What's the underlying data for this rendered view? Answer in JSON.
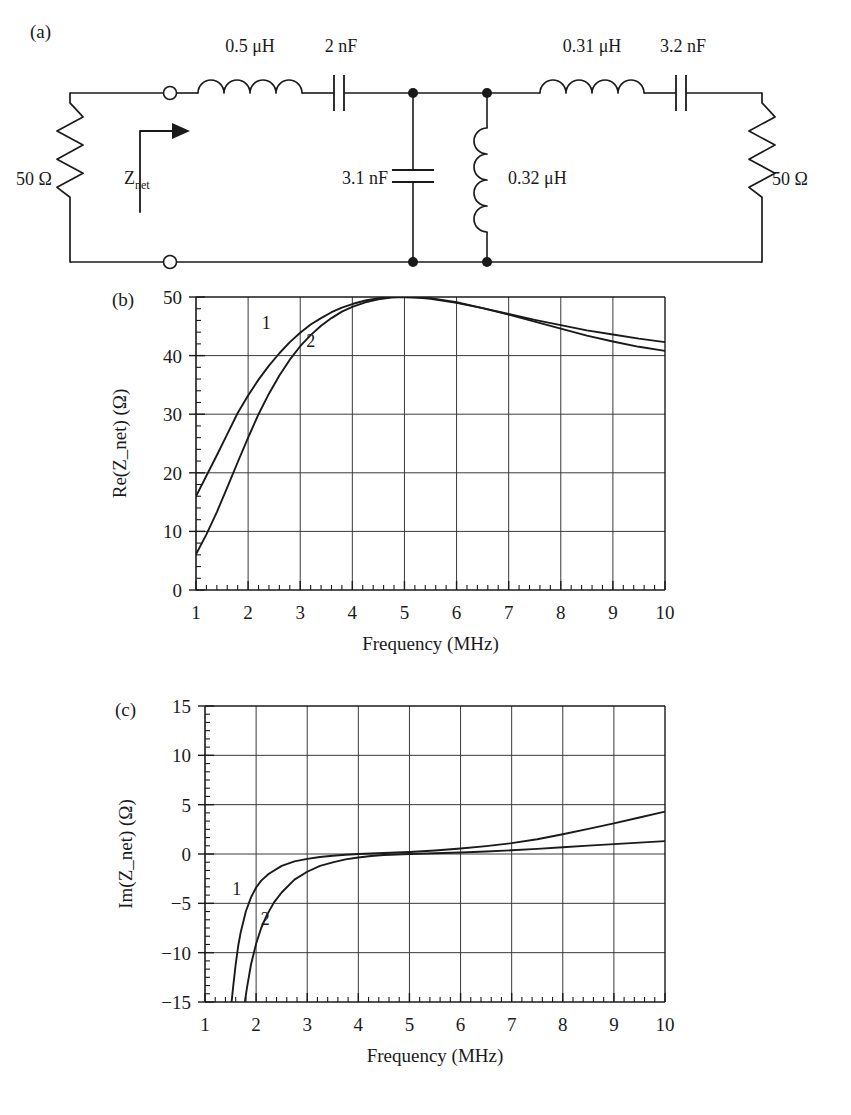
{
  "figure": {
    "panels": [
      {
        "tag": "(a)",
        "kind": "circuit-schematic"
      },
      {
        "tag": "(b)",
        "kind": "chart"
      },
      {
        "tag": "(c)",
        "kind": "chart"
      }
    ]
  },
  "circuit": {
    "tag": "(a)",
    "source_resistor_label": "50 Ω",
    "load_resistor_label": "50 Ω",
    "input_impedance_label_main": "Z",
    "input_impedance_label_sub": "net",
    "series_inductor_1": "0.5 μH",
    "series_capacitor_1": "2 nF",
    "shunt_capacitor": "3.1 nF",
    "shunt_inductor": "0.32 μH",
    "series_inductor_2": "0.31 μH",
    "series_capacitor_2": "3.2 nF",
    "icons": [
      "resistor-icon",
      "inductor-icon",
      "capacitor-icon",
      "terminal-node-icon",
      "junction-dot-icon",
      "current-direction-arrow-icon"
    ]
  },
  "chart_data": [
    {
      "panel": "(b)",
      "type": "line",
      "title": "",
      "xlabel": "Frequency (MHz)",
      "ylabel": "Re(Z_net) (Ω)",
      "xlim": [
        1,
        10
      ],
      "ylim": [
        0,
        50
      ],
      "xticks": [
        1,
        2,
        3,
        4,
        5,
        6,
        7,
        8,
        9,
        10
      ],
      "yticks": [
        0,
        10,
        20,
        30,
        40,
        50
      ],
      "xticklabels": [
        "1",
        "2",
        "3",
        "4",
        "5",
        "6",
        "7",
        "8",
        "9",
        "10"
      ],
      "yticklabels": [
        "0",
        "10",
        "20",
        "30",
        "40",
        "50"
      ],
      "xminor_per_interval": 4,
      "yminor_per_interval": 4,
      "grid": true,
      "legend": "inline-curve-labels",
      "annotations": [
        {
          "text": "1",
          "x": 2.35,
          "y": 44.6
        },
        {
          "text": "2",
          "x": 3.2,
          "y": 41.4
        }
      ],
      "series": [
        {
          "name": "1",
          "x": [
            1.0,
            1.2,
            1.4,
            1.6,
            1.8,
            2.0,
            2.2,
            2.4,
            2.6,
            2.8,
            3.0,
            3.2,
            3.4,
            3.6,
            3.8,
            4.0,
            4.25,
            4.5,
            4.75,
            5.0,
            5.25,
            5.5,
            6.0,
            6.5,
            7.0,
            7.5,
            8.0,
            8.5,
            9.0,
            9.5,
            10.0
          ],
          "y": [
            16.0,
            19.5,
            23.0,
            26.6,
            30.2,
            33.2,
            35.9,
            38.3,
            40.4,
            42.3,
            43.9,
            45.3,
            46.4,
            47.4,
            48.2,
            48.8,
            49.4,
            49.8,
            50.0,
            50.0,
            49.9,
            49.7,
            49.0,
            48.1,
            47.1,
            46.1,
            45.2,
            44.3,
            43.6,
            42.9,
            42.3
          ]
        },
        {
          "name": "2",
          "x": [
            1.0,
            1.2,
            1.4,
            1.6,
            1.8,
            2.0,
            2.2,
            2.4,
            2.6,
            2.8,
            3.0,
            3.2,
            3.4,
            3.6,
            3.8,
            4.0,
            4.25,
            4.5,
            4.75,
            5.0,
            5.25,
            5.5,
            6.0,
            6.5,
            7.0,
            7.5,
            8.0,
            8.5,
            9.0,
            9.5,
            10.0
          ],
          "y": [
            6.1,
            9.5,
            13.3,
            17.5,
            21.8,
            26.0,
            30.0,
            33.5,
            36.6,
            39.3,
            41.6,
            43.5,
            45.1,
            46.4,
            47.5,
            48.3,
            49.1,
            49.6,
            49.9,
            50.0,
            49.9,
            49.8,
            49.1,
            48.1,
            47.0,
            45.8,
            44.6,
            43.4,
            42.4,
            41.5,
            40.8
          ]
        }
      ]
    },
    {
      "panel": "(c)",
      "type": "line",
      "title": "",
      "xlabel": "Frequency (MHz)",
      "ylabel": "Im(Z_net) (Ω)",
      "xlim": [
        1,
        10
      ],
      "ylim": [
        -15,
        15
      ],
      "xticks": [
        1,
        2,
        3,
        4,
        5,
        6,
        7,
        8,
        9,
        10
      ],
      "yticks": [
        -15,
        -10,
        -5,
        0,
        5,
        10,
        15
      ],
      "xticklabels": [
        "1",
        "2",
        "3",
        "4",
        "5",
        "6",
        "7",
        "8",
        "9",
        "10"
      ],
      "yticklabels": [
        "−15",
        "−10",
        "−5",
        "0",
        "5",
        "10",
        "15"
      ],
      "xminor_per_interval": 4,
      "yminor_per_interval": 5,
      "grid": true,
      "legend": "inline-curve-labels",
      "annotations": [
        {
          "text": "1",
          "x": 1.62,
          "y": -4.2
        },
        {
          "text": "2",
          "x": 2.18,
          "y": -7.2
        }
      ],
      "series": [
        {
          "name": "1",
          "x": [
            1.52,
            1.55,
            1.6,
            1.65,
            1.7,
            1.8,
            1.9,
            2.0,
            2.1,
            2.25,
            2.5,
            2.75,
            3.0,
            3.25,
            3.5,
            3.75,
            4.0,
            4.5,
            5.0,
            5.5,
            6.0,
            6.5,
            7.0,
            7.5,
            8.0,
            8.5,
            9.0,
            9.5,
            10.0
          ],
          "y": [
            -15.0,
            -13.5,
            -11.2,
            -9.3,
            -7.9,
            -5.8,
            -4.4,
            -3.4,
            -2.7,
            -2.0,
            -1.2,
            -0.75,
            -0.5,
            -0.3,
            -0.18,
            -0.08,
            0.0,
            0.1,
            0.2,
            0.35,
            0.55,
            0.8,
            1.1,
            1.5,
            2.0,
            2.55,
            3.1,
            3.7,
            4.3
          ]
        },
        {
          "name": "2",
          "x": [
            1.78,
            1.82,
            1.9,
            2.0,
            2.1,
            2.2,
            2.35,
            2.5,
            2.75,
            3.0,
            3.25,
            3.5,
            3.75,
            4.0,
            4.25,
            4.5,
            5.0,
            5.5,
            6.0,
            6.5,
            7.0,
            7.5,
            8.0,
            8.5,
            9.0,
            9.5,
            10.0
          ],
          "y": [
            -15.0,
            -13.6,
            -11.2,
            -9.1,
            -7.5,
            -6.3,
            -4.9,
            -3.9,
            -2.6,
            -1.8,
            -1.2,
            -0.85,
            -0.55,
            -0.35,
            -0.2,
            -0.1,
            0.0,
            0.08,
            0.15,
            0.25,
            0.38,
            0.52,
            0.68,
            0.85,
            1.0,
            1.15,
            1.3
          ]
        }
      ]
    }
  ],
  "colors": {
    "ink": "#1a1a1a",
    "grid": "#3a3a3a",
    "axis": "#1a1a1a",
    "background": "#ffffff"
  }
}
